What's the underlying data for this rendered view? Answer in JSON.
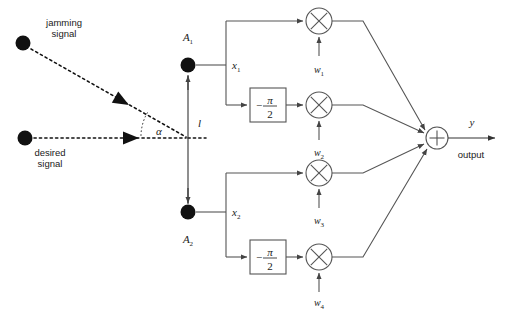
{
  "figure": {
    "background_color": "#ffffff",
    "line_color": "#555555",
    "dot_color": "#111111"
  },
  "sources": [
    {
      "id": "jamming",
      "label_line1": "jamming",
      "label_line2": "signal",
      "dot_x": 23,
      "dot_y": 43,
      "dot_r": 7.5
    },
    {
      "id": "desired",
      "label_line1": "desired",
      "label_line2": "signal",
      "dot_x": 25,
      "dot_y": 138,
      "dot_r": 7.5
    }
  ],
  "geometry": {
    "angle_label": "α",
    "baseline_label": "l",
    "array_center_x": 188,
    "baseline_y": 138
  },
  "antennas": [
    {
      "id": "A1",
      "label": "A",
      "sub": "1",
      "dot_x": 188,
      "dot_y": 65,
      "signal_label": "x",
      "signal_sub": "1"
    },
    {
      "id": "A2",
      "label": "A",
      "sub": "2",
      "dot_x": 188,
      "dot_y": 212,
      "signal_label": "x",
      "signal_sub": "2"
    }
  ],
  "phase_shifters": [
    {
      "id": "ps-top",
      "numerator": "π",
      "denominator": "2",
      "sign": "−",
      "x": 250,
      "y": 88,
      "w": 36,
      "h": 34
    },
    {
      "id": "ps-bottom",
      "numerator": "π",
      "denominator": "2",
      "sign": "−",
      "x": 250,
      "y": 240,
      "w": 36,
      "h": 34
    }
  ],
  "multipliers": [
    {
      "id": "mul1",
      "glyph": "×",
      "cx": 319,
      "cy": 21,
      "r": 13,
      "weight": "w",
      "weight_sub": "1",
      "weight_label_y": 70
    },
    {
      "id": "mul2",
      "glyph": "×",
      "cx": 319,
      "cy": 105,
      "r": 13,
      "weight": "w",
      "weight_sub": "2",
      "weight_label_y": 153
    },
    {
      "id": "mul3",
      "glyph": "×",
      "cx": 319,
      "cy": 173,
      "r": 13,
      "weight": "w",
      "weight_sub": "3",
      "weight_label_y": 221
    },
    {
      "id": "mul4",
      "glyph": "×",
      "cx": 319,
      "cy": 257,
      "r": 13,
      "weight": "w",
      "weight_sub": "4",
      "weight_label_y": 303
    }
  ],
  "summing_junction": {
    "id": "sum",
    "glyph": "+",
    "cx": 437,
    "cy": 138,
    "r": 11
  },
  "output": {
    "symbol": "y",
    "caption": "output",
    "arrow_end_x": 497,
    "y": 138
  }
}
